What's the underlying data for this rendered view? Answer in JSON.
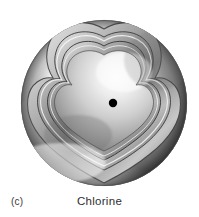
{
  "figure": {
    "panel_label": "(c)",
    "element_label": "Chlorine",
    "background_color": "#ffffff",
    "text_color": "#2e2e2e",
    "panel_label_color": "#3a3a3a"
  },
  "illustration": {
    "type": "cutaway-atom-sphere",
    "style": "grayscale-airbrush",
    "nucleus": {
      "name": "nucleus-dot",
      "cx": 113,
      "cy": 103,
      "r": 4.2,
      "color": "#000000"
    },
    "outer_sphere": {
      "name": "outer-electron-shell",
      "cx": 104,
      "cy": 103,
      "r": 83,
      "highlight_color": "#ffffff",
      "shadow_color": "#3c3c3c",
      "mid_color": "#b8b8b8"
    },
    "shell_count": 3,
    "shells": [
      {
        "label": "shell-1-outer-cut",
        "scale": 1.0,
        "edge_color": "#4a4a4a"
      },
      {
        "label": "shell-2-middle-cut",
        "scale": 0.86,
        "edge_color": "#555555"
      },
      {
        "label": "shell-3-inner-cut",
        "scale": 0.73,
        "edge_color": "#606060"
      }
    ],
    "cutaway": {
      "name": "quadrant-cutaway",
      "description": "wedge removed from upper-right exposing nested shells"
    }
  }
}
